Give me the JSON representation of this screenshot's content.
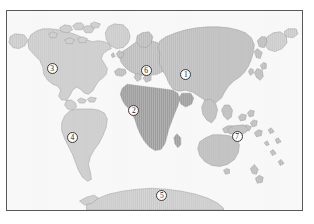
{
  "figure": {
    "type": "world-map",
    "frame": {
      "border_color": "#58585a",
      "background_color": "#f7f7f7"
    },
    "projection": "robinson"
  },
  "colors": {
    "ocean": "#f7f7f7",
    "land_light": "#cacaca",
    "land_medium": "#bcbcbc",
    "land_dark": "#9c9c9c",
    "coastline": "#8a8a8c",
    "frame": "#58585a",
    "marker_fill": "#fdfdfd",
    "marker_border": "#3a3a3c",
    "marker_text": "#1c1c1e"
  },
  "markers": [
    {
      "id": "asia",
      "label": "1",
      "x": 60.6,
      "y": 32.0,
      "region": "Asia"
    },
    {
      "id": "africa",
      "label": "2",
      "x": 43.0,
      "y": 49.8,
      "region": "Africa"
    },
    {
      "id": "north-america",
      "label": "3",
      "x": 15.3,
      "y": 29.0,
      "region": "North America"
    },
    {
      "id": "south-america",
      "label": "4",
      "x": 22.2,
      "y": 63.5,
      "region": "South America"
    },
    {
      "id": "antarctica",
      "label": "5",
      "x": 52.5,
      "y": 92.5,
      "region": "Antarctica"
    },
    {
      "id": "europe",
      "label": "6",
      "x": 47.2,
      "y": 29.8,
      "region": "Europe"
    },
    {
      "id": "oceania",
      "label": "7",
      "x": 78.0,
      "y": 63.0,
      "region": "Oceania"
    }
  ]
}
